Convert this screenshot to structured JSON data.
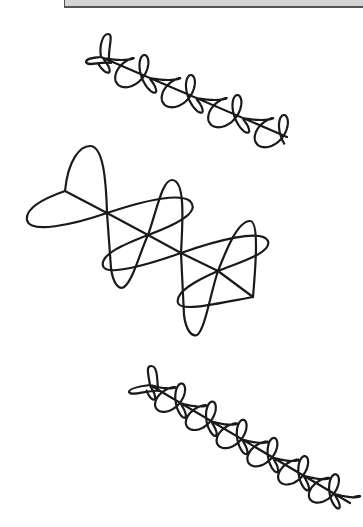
{
  "page": {
    "width": 362,
    "height": 527,
    "background": "#ffffff"
  },
  "top_bar": {
    "color": "#d4d4d4",
    "border_color": "#555555"
  },
  "stroke": {
    "color": "#1a1a1a",
    "width": 2.2
  },
  "figures": [
    {
      "name": "top-curve",
      "start": [
        101,
        57
      ],
      "end": [
        287,
        137
      ],
      "lobes": 8,
      "amp_perp": 13,
      "amp_axis": 9,
      "tail_loop_top": [
        108,
        34
      ],
      "tail_loop_left": [
        86,
        62
      ]
    },
    {
      "name": "middle-curve",
      "tail": [
        65,
        191
      ],
      "end": [
        253,
        297
      ],
      "crossings": [
        [
          107,
          213
        ],
        [
          148,
          235
        ],
        [
          181,
          253
        ],
        [
          218,
          271
        ]
      ],
      "vertical_lobe_tops": [
        [
          90,
          146
        ],
        [
          172,
          180
        ],
        [
          250,
          221
        ]
      ],
      "vertical_lobe_bottoms": [
        [
          122,
          287
        ],
        [
          197,
          335
        ]
      ],
      "horizontal_lobe_left": [
        [
          27,
          220
        ],
        [
          103,
          270
        ],
        [
          178,
          305
        ]
      ],
      "horizontal_lobe_right": [
        [
          192,
          210
        ],
        [
          268,
          245
        ]
      ]
    },
    {
      "name": "bottom-curve",
      "start": [
        150,
        385
      ],
      "end": [
        350,
        503
      ],
      "lobes": 13,
      "amp_perp": 12,
      "amp_axis": 8,
      "tail_loop_top": [
        151,
        366
      ],
      "tail_loop_left": [
        129,
        392
      ]
    }
  ]
}
